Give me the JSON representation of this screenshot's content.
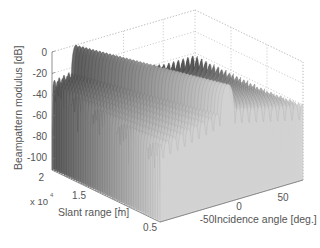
{
  "chart_data": {
    "type": "surface3d",
    "title": "",
    "xlabel": "Incidence angle [deg.]",
    "ylabel": "Slant range [m]",
    "zlabel": "Beampattern modulus [dB]",
    "y_exponent_label": "x 10",
    "y_exponent_power": "4",
    "xlim": [
      -90,
      90
    ],
    "ylim": [
      0.5,
      2
    ],
    "zlim": [
      -110,
      0
    ],
    "x_ticks": [
      "-50",
      "0",
      "50"
    ],
    "y_ticks": [
      "2",
      "1.5",
      "1",
      "0.5"
    ],
    "z_ticks": [
      "0",
      "-20",
      "-40",
      "-60",
      "-80",
      "-100"
    ],
    "grid": true,
    "colormap": "gray",
    "peaks": [
      {
        "incidence_angle_deg": -60,
        "slant_range_x1e4": 2.0,
        "value_db": 0
      },
      {
        "incidence_angle_deg": -5,
        "slant_range_x1e4": 0.5,
        "value_db": 0
      }
    ],
    "sidelobe_floor_db": -40,
    "null_depth_db": -110
  },
  "axes": {
    "z_label": "Beampattern modulus [dB]",
    "y_label": "Slant range [m]",
    "x_label": "Incidence angle [deg.]",
    "exponent": "x 10",
    "exponent_power": "4"
  }
}
